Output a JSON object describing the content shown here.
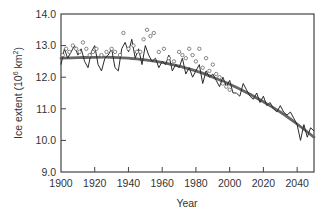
{
  "chart_data": {
    "type": "line",
    "title": "",
    "xlabel": "Year",
    "ylabel": "Ice extent (10^6 km^2)",
    "ylabel_parts": {
      "main": "Ice extent (10",
      "sup1": "6",
      "mid": " km",
      "sup2": "2",
      "end": ")"
    },
    "xlim": [
      1900,
      2050
    ],
    "ylim": [
      9.0,
      14.0
    ],
    "x_ticks": [
      1900,
      1920,
      1940,
      1960,
      1980,
      2000,
      2020,
      2040
    ],
    "x_tick_labels": [
      "1900",
      "1920",
      "1940",
      "1960",
      "1980",
      "2000",
      "2020",
      "2040"
    ],
    "y_ticks": [
      9.0,
      10.0,
      11.0,
      12.0,
      13.0,
      14.0
    ],
    "y_tick_labels": [
      "9.0",
      "10.0",
      "11.0",
      "12.0",
      "13.0",
      "14.0"
    ],
    "grid": false,
    "legend": null,
    "colors": {
      "observed_line": "#2a2a2a",
      "fit_curve": "#666666",
      "circles": "#555555",
      "axis": "#444444"
    },
    "series": [
      {
        "name": "Modelled / observed annual extent",
        "style": "jagged-line",
        "x": [
          1900,
          1902,
          1904,
          1906,
          1908,
          1910,
          1912,
          1914,
          1916,
          1918,
          1920,
          1922,
          1924,
          1926,
          1928,
          1930,
          1932,
          1934,
          1936,
          1938,
          1940,
          1942,
          1944,
          1946,
          1948,
          1950,
          1952,
          1954,
          1956,
          1958,
          1960,
          1962,
          1964,
          1966,
          1968,
          1970,
          1972,
          1974,
          1976,
          1978,
          1980,
          1982,
          1984,
          1986,
          1988,
          1990,
          1992,
          1994,
          1996,
          1998,
          2000,
          2002,
          2004,
          2006,
          2008,
          2010,
          2012,
          2014,
          2016,
          2018,
          2020,
          2022,
          2024,
          2026,
          2028,
          2030,
          2032,
          2034,
          2036,
          2038,
          2040,
          2042,
          2044,
          2046,
          2048,
          2050
        ],
        "values": [
          12.4,
          12.9,
          12.6,
          12.8,
          13.0,
          12.7,
          12.9,
          12.5,
          12.3,
          12.8,
          13.0,
          12.4,
          12.2,
          12.6,
          12.7,
          12.9,
          12.3,
          12.2,
          12.9,
          13.1,
          12.8,
          13.2,
          12.6,
          12.9,
          12.4,
          13.0,
          12.7,
          12.5,
          12.6,
          12.3,
          12.5,
          12.4,
          12.7,
          12.2,
          12.4,
          12.3,
          12.6,
          12.1,
          12.3,
          12.0,
          12.2,
          12.4,
          11.8,
          12.2,
          12.0,
          12.1,
          11.9,
          11.7,
          12.0,
          11.7,
          11.9,
          11.5,
          11.5,
          11.4,
          11.8,
          11.6,
          11.4,
          11.3,
          11.5,
          11.2,
          11.4,
          11.1,
          11.2,
          11.0,
          10.9,
          11.1,
          10.9,
          10.8,
          10.9,
          10.7,
          10.5,
          10.0,
          10.5,
          10.1,
          10.4,
          10.3
        ]
      },
      {
        "name": "Fitted trend",
        "style": "smooth-thick-line",
        "x": [
          1900,
          1910,
          1920,
          1930,
          1940,
          1950,
          1960,
          1970,
          1980,
          1990,
          2000,
          2010,
          2020,
          2030,
          2040,
          2050
        ],
        "values": [
          12.6,
          12.62,
          12.63,
          12.63,
          12.6,
          12.55,
          12.47,
          12.35,
          12.2,
          12.0,
          11.78,
          11.52,
          11.22,
          10.9,
          10.52,
          10.1
        ]
      },
      {
        "name": "Observations",
        "style": "open-circles",
        "x": [
          1901,
          1903,
          1905,
          1907,
          1909,
          1911,
          1913,
          1915,
          1917,
          1919,
          1921,
          1924,
          1927,
          1930,
          1932,
          1935,
          1937,
          1940,
          1943,
          1945,
          1947,
          1949,
          1951,
          1953,
          1955,
          1958,
          1961,
          1964,
          1967,
          1970,
          1972,
          1974,
          1976,
          1978,
          1980,
          1982,
          1984,
          1986,
          1988,
          1990,
          1992,
          1994,
          1996,
          1998,
          2000
        ],
        "values": [
          12.7,
          12.9,
          12.8,
          13.0,
          12.9,
          12.8,
          13.1,
          12.9,
          12.7,
          12.8,
          12.9,
          12.7,
          12.8,
          12.9,
          12.8,
          12.7,
          13.4,
          12.9,
          13.0,
          12.8,
          12.8,
          13.2,
          13.5,
          13.3,
          13.4,
          12.8,
          12.9,
          12.6,
          12.5,
          12.8,
          12.7,
          12.6,
          12.9,
          12.7,
          12.5,
          12.9,
          12.3,
          12.6,
          12.2,
          12.4,
          12.1,
          12.0,
          11.8,
          11.7,
          11.6
        ]
      }
    ]
  }
}
